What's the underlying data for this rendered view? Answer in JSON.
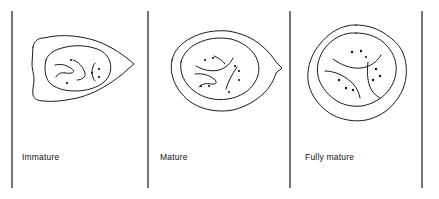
{
  "figure": {
    "background_color": "#ffffff",
    "ink_color": "#1a1a1a",
    "granule_color": "#111111",
    "width": 439,
    "height": 199
  },
  "dividers": [
    {
      "name": "divider-left",
      "x": 12,
      "y1": 11,
      "y2": 188
    },
    {
      "name": "divider-one-two",
      "x": 148,
      "y1": 11,
      "y2": 188
    },
    {
      "name": "divider-two-three",
      "x": 290,
      "y1": 11,
      "y2": 188
    },
    {
      "name": "divider-right",
      "x": 422,
      "y1": 11,
      "y2": 188
    }
  ],
  "panels": [
    {
      "id": "immature",
      "label": "Immature",
      "shape": "irregular lumpy oval, pointed at right",
      "outer_membrane": "irregular polygon outline",
      "inner_nucleus": "smaller irregular oval inside, offset right",
      "internal_squiggles": 3,
      "granule_count": 5,
      "cytoplasm_gap": "wide on left, narrow on right"
    },
    {
      "id": "mature",
      "label": "Mature",
      "shape": "rounder lumpy oval, pointed at right",
      "outer_membrane": "irregular polygon outline",
      "inner_nucleus": "large irregular oval, nearly centered",
      "internal_squiggles": 4,
      "granule_count": 8,
      "cytoplasm_gap": "even, moderate"
    },
    {
      "id": "fully-mature",
      "label": "Fully mature",
      "shape": "near-circular wavy outline",
      "outer_membrane": "wavy circular outline",
      "inner_nucleus": "large near-circular nucleus, centered",
      "internal_squiggles": 3,
      "granule_count": 9,
      "cytoplasm_gap": "narrow, even ring"
    }
  ],
  "captions": {
    "immature": "Immature",
    "mature": "Mature",
    "fully_mature": "Fully mature"
  }
}
